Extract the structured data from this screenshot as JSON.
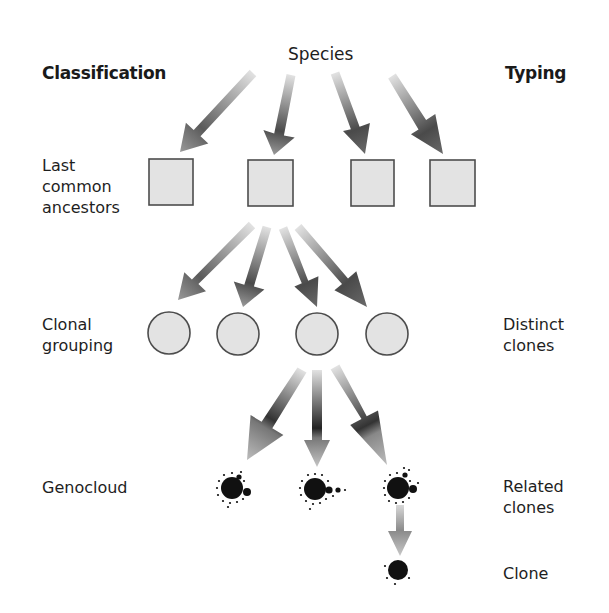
{
  "title": "Species",
  "headers": {
    "left": "Classification",
    "right": "Typing"
  },
  "left_labels": [
    {
      "id": "last-common-ancestors",
      "text": "Last\ncommon\nancestors"
    },
    {
      "id": "clonal-grouping",
      "text": "Clonal\ngrouping"
    },
    {
      "id": "genocloud",
      "text": "Genocloud"
    }
  ],
  "right_labels": [
    {
      "id": "distinct-clones",
      "text": "Distinct\nclones"
    },
    {
      "id": "related-clones",
      "text": "Related\nclones"
    },
    {
      "id": "clone",
      "text": "Clone"
    }
  ],
  "colors": {
    "node_fill": "#e3e3e3",
    "node_stroke": "#4d4d4d",
    "arrow_dark": "#3e3e3e",
    "arrow_light": "#dcdcdc",
    "dot": "#111111"
  },
  "levels": {
    "ancestors": {
      "shape": "square",
      "count": 4
    },
    "clonal_groups": {
      "shape": "circle",
      "count": 4
    },
    "genoclouds": {
      "shape": "genocloud",
      "count": 3
    },
    "clone": {
      "shape": "dot",
      "count": 1
    }
  }
}
